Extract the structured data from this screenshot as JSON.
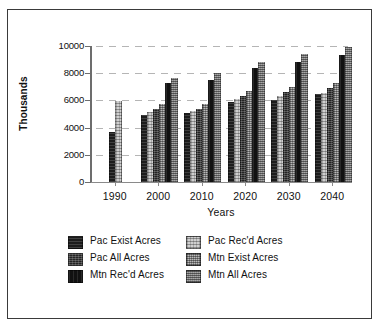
{
  "chart_data": {
    "type": "bar",
    "title": "",
    "xlabel": "Years",
    "ylabel": "Thousands",
    "categories": [
      "1990",
      "2000",
      "2010",
      "2020",
      "2030",
      "2040"
    ],
    "ylim": [
      0,
      10000
    ],
    "yticks": [
      0,
      2000,
      4000,
      6000,
      8000,
      10000
    ],
    "ytick_labels": [
      "0",
      "2000",
      "4000",
      "6000",
      "8000",
      "10000"
    ],
    "grid": true,
    "legend_position": "bottom",
    "series": [
      {
        "name": "Pac Exist Acres",
        "pattern": "p-dark",
        "values": [
          3700,
          4900,
          5050,
          5850,
          6050,
          6450
        ]
      },
      {
        "name": "Pac Rec'd Acres",
        "pattern": "p-lightest",
        "values": [
          5950,
          5150,
          5200,
          6100,
          6300,
          6550
        ]
      },
      {
        "name": "Pac All Acres",
        "pattern": "p-darkgrain",
        "values": [
          null,
          5350,
          5400,
          6350,
          6600,
          6900
        ]
      },
      {
        "name": "Mtn Exist Acres",
        "pattern": "p-light",
        "values": [
          null,
          5700,
          5750,
          6700,
          7000,
          7300
        ]
      },
      {
        "name": "Mtn Rec'd Acres",
        "pattern": "p-black",
        "values": [
          null,
          7250,
          7500,
          8350,
          8850,
          9350
        ]
      },
      {
        "name": "Mtn All Acres",
        "pattern": "p-mid",
        "values": [
          null,
          7650,
          8000,
          8850,
          9400,
          9950
        ]
      }
    ]
  },
  "legend": {
    "left_column": [
      {
        "label": "Pac Exist Acres",
        "pattern": "p-dark"
      },
      {
        "label": "Pac All Acres",
        "pattern": "p-darkgrain"
      },
      {
        "label": "Mtn Rec'd Acres",
        "pattern": "p-black"
      }
    ],
    "right_column": [
      {
        "label": "Pac Rec'd Acres",
        "pattern": "p-lightest"
      },
      {
        "label": "Mtn Exist Acres",
        "pattern": "p-light"
      },
      {
        "label": "Mtn All Acres",
        "pattern": "p-mid"
      }
    ]
  }
}
